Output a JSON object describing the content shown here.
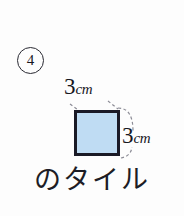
{
  "problem": {
    "item_number": "4",
    "caption": "のタイル",
    "tile": {
      "fill_color": "#bfdcf3",
      "border_color": "#1a1a26",
      "top_label": {
        "value": "3",
        "unit": "cm"
      },
      "right_label": {
        "value": "3",
        "unit": "cm"
      }
    },
    "guides": {
      "style": "dashed",
      "color": "#8c8c96"
    }
  }
}
